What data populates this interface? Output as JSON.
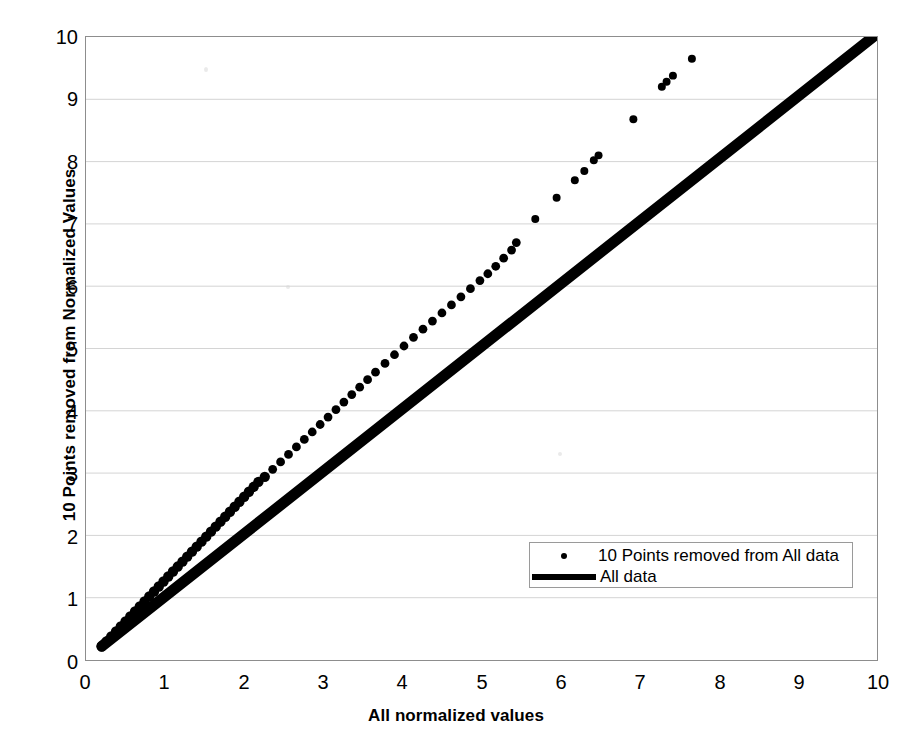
{
  "chart_data": {
    "type": "scatter",
    "title": "",
    "xlabel": "All normalized values",
    "ylabel": "10 Points removed from Normalized Values",
    "xlim": [
      0,
      10
    ],
    "ylim": [
      0,
      10
    ],
    "xticks": [
      0,
      1,
      2,
      3,
      4,
      5,
      6,
      7,
      8,
      9,
      10
    ],
    "yticks": [
      0,
      1,
      2,
      3,
      4,
      5,
      6,
      7,
      8,
      9,
      10
    ],
    "grid": "horizontal",
    "grid_color": "#d4d4d4",
    "axis_color": "#8d8d8d",
    "series_color": "#000000",
    "legend_position": "inside-bottom-right",
    "series": [
      {
        "name": "10 Points removed from All data",
        "marker": "dot",
        "style": "scatter",
        "points": [
          [
            0.2,
            0.22
          ],
          [
            0.26,
            0.3
          ],
          [
            0.32,
            0.38
          ],
          [
            0.38,
            0.46
          ],
          [
            0.44,
            0.54
          ],
          [
            0.5,
            0.62
          ],
          [
            0.56,
            0.7
          ],
          [
            0.62,
            0.78
          ],
          [
            0.68,
            0.86
          ],
          [
            0.74,
            0.94
          ],
          [
            0.8,
            1.02
          ],
          [
            0.86,
            1.1
          ],
          [
            0.92,
            1.18
          ],
          [
            0.98,
            1.26
          ],
          [
            1.04,
            1.34
          ],
          [
            1.1,
            1.42
          ],
          [
            1.16,
            1.5
          ],
          [
            1.22,
            1.58
          ],
          [
            1.28,
            1.66
          ],
          [
            1.34,
            1.74
          ],
          [
            1.4,
            1.82
          ],
          [
            1.46,
            1.9
          ],
          [
            1.52,
            1.98
          ],
          [
            1.58,
            2.06
          ],
          [
            1.64,
            2.14
          ],
          [
            1.7,
            2.22
          ],
          [
            1.76,
            2.3
          ],
          [
            1.82,
            2.38
          ],
          [
            1.88,
            2.46
          ],
          [
            1.94,
            2.54
          ],
          [
            2.0,
            2.62
          ],
          [
            2.06,
            2.7
          ],
          [
            2.12,
            2.78
          ],
          [
            2.18,
            2.86
          ],
          [
            2.26,
            2.94
          ],
          [
            2.36,
            3.06
          ],
          [
            2.46,
            3.18
          ],
          [
            2.56,
            3.3
          ],
          [
            2.66,
            3.42
          ],
          [
            2.76,
            3.54
          ],
          [
            2.86,
            3.66
          ],
          [
            2.96,
            3.78
          ],
          [
            3.06,
            3.9
          ],
          [
            3.16,
            4.02
          ],
          [
            3.26,
            4.14
          ],
          [
            3.36,
            4.26
          ],
          [
            3.46,
            4.38
          ],
          [
            3.56,
            4.5
          ],
          [
            3.66,
            4.62
          ],
          [
            3.78,
            4.76
          ],
          [
            3.9,
            4.9
          ],
          [
            4.02,
            5.04
          ],
          [
            4.14,
            5.18
          ],
          [
            4.26,
            5.31
          ],
          [
            4.38,
            5.44
          ],
          [
            4.5,
            5.57
          ],
          [
            4.62,
            5.7
          ],
          [
            4.74,
            5.83
          ],
          [
            4.86,
            5.96
          ],
          [
            4.98,
            6.09
          ],
          [
            5.08,
            6.2
          ],
          [
            5.18,
            6.32
          ],
          [
            5.28,
            6.45
          ],
          [
            5.38,
            6.58
          ],
          [
            5.44,
            6.7
          ],
          [
            5.68,
            7.08
          ],
          [
            5.95,
            7.42
          ],
          [
            6.18,
            7.7
          ],
          [
            6.3,
            7.85
          ],
          [
            6.42,
            8.02
          ],
          [
            6.48,
            8.1
          ],
          [
            6.92,
            8.68
          ],
          [
            7.28,
            9.2
          ],
          [
            7.34,
            9.28
          ],
          [
            7.42,
            9.38
          ],
          [
            7.66,
            9.65
          ]
        ]
      },
      {
        "name": "All data",
        "marker": "none",
        "style": "thick-line",
        "points": [
          [
            0.2,
            0.22
          ],
          [
            10.0,
            10.05
          ]
        ]
      }
    ]
  },
  "axis": {
    "x_title": "All normalized values",
    "y_title": "10 Points removed from Normalized Values",
    "x_tick_labels": [
      "0",
      "1",
      "2",
      "3",
      "4",
      "5",
      "6",
      "7",
      "8",
      "9",
      "10"
    ],
    "y_tick_labels": [
      "0",
      "1",
      "2",
      "3",
      "4",
      "5",
      "6",
      "7",
      "8",
      "9",
      "10"
    ]
  },
  "legend": {
    "entries": [
      {
        "label": "10 Points removed from All data",
        "key": "dot-marker"
      },
      {
        "label": "All data",
        "key": "line-swatch"
      }
    ]
  }
}
